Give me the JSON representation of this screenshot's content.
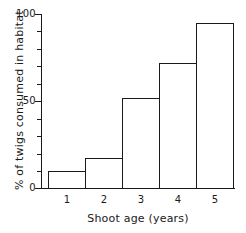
{
  "chart_data": {
    "type": "bar",
    "title": "",
    "xlabel": "Shoot age (years)",
    "ylabel": "% of twigs consumed in habitat",
    "categories": [
      "1",
      "2",
      "3",
      "4",
      "5"
    ],
    "values": [
      10,
      17,
      52,
      72,
      95
    ],
    "ylim": [
      0,
      100
    ],
    "ytick_labels": [
      "0",
      "50",
      "100"
    ],
    "ytick_values": [
      0,
      50,
      100
    ],
    "yminor_step": 10,
    "grid": false,
    "legend": null,
    "bar_fill": "none",
    "line_color": "#1a1a1a",
    "background": "#ffffff"
  }
}
